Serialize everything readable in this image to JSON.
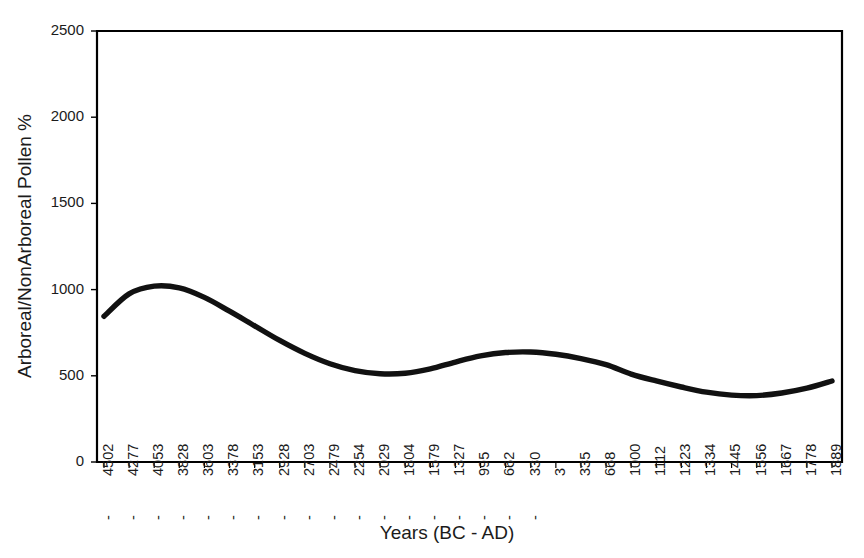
{
  "chart_data": {
    "type": "line",
    "title": "",
    "xlabel": "Years (BC - AD)",
    "ylabel": "Arboreal/NonArboreal Pollen %",
    "ylim": [
      0,
      2500
    ],
    "yticks": [
      0,
      500,
      1000,
      1500,
      2000,
      2500
    ],
    "ytick_labels": [
      "0",
      "500",
      "1000",
      "1500",
      "2000",
      "2500"
    ],
    "grid": false,
    "legend": "none",
    "categories": [
      "-4502",
      "-4277",
      "-4053",
      "-3828",
      "-3603",
      "-3378",
      "-3153",
      "-2928",
      "-2703",
      "-2479",
      "-2254",
      "-2029",
      "-1804",
      "-1579",
      "-1327",
      "-995",
      "-662",
      "-330",
      "3",
      "335",
      "668",
      "1000",
      "1112",
      "1223",
      "1334",
      "1445",
      "1556",
      "1667",
      "1778",
      "1889"
    ],
    "x_values": [
      -4502,
      -4277,
      -4053,
      -3828,
      -3603,
      -3378,
      -3153,
      -2928,
      -2703,
      -2479,
      -2254,
      -2029,
      -1804,
      -1579,
      -1327,
      -995,
      -662,
      -330,
      3,
      335,
      668,
      1000,
      1112,
      1223,
      1334,
      1445,
      1556,
      1667,
      1778,
      1889
    ],
    "series": [
      {
        "name": "Arboreal/NonArboreal Pollen %",
        "color": "#111111",
        "values": [
          845,
          975,
          1020,
          1010,
          955,
          875,
          790,
          705,
          630,
          570,
          530,
          512,
          515,
          540,
          580,
          615,
          635,
          638,
          625,
          600,
          565,
          510,
          470,
          435,
          405,
          388,
          385,
          400,
          428,
          470
        ]
      }
    ]
  }
}
